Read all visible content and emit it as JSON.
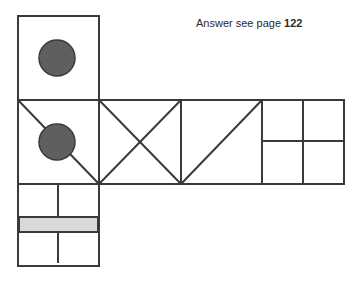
{
  "caption": {
    "prefix": "Answer see page",
    "page": "122"
  },
  "colors": {
    "stroke": "#3a3a3a",
    "circle_fill": "#5f5f5f",
    "band_fill": "#d9d9d9",
    "background": "#ffffff"
  },
  "net": {
    "description": "Cube net puzzle: six squares with markings",
    "faces": [
      {
        "id": "top",
        "marking": "filled circle"
      },
      {
        "id": "left",
        "marking": "filled circle with diagonal line"
      },
      {
        "id": "middle-1",
        "marking": "X (two diagonals)"
      },
      {
        "id": "middle-2",
        "marking": "single diagonal"
      },
      {
        "id": "right",
        "marking": "four-quadrant grid"
      },
      {
        "id": "bottom",
        "marking": "gray horizontal band with vertical split line"
      }
    ]
  }
}
